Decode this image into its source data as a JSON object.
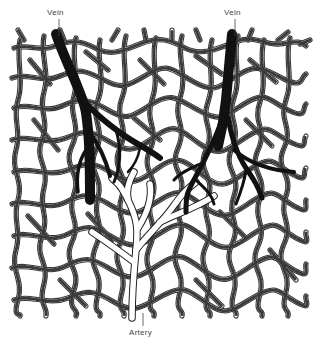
{
  "figure": {
    "labels": {
      "vein_left": "Vein",
      "vein_right": "Vein",
      "artery": "Artery"
    },
    "colors": {
      "background": "#ffffff",
      "capillary": "#3a3a3a",
      "vein": "#111111",
      "artery_outline": "#222222",
      "label": "#444444"
    },
    "elements": {
      "capillary_mesh": "capillary-network",
      "veins": [
        "vein-left",
        "vein-right"
      ],
      "artery": "artery-tree"
    }
  }
}
